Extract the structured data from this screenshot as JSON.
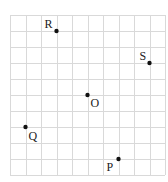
{
  "diagram": {
    "type": "grid-points",
    "grid": {
      "columns": 10,
      "rows": 10,
      "origin_px": [
        10,
        15
      ],
      "cell_w": 15.5,
      "cell_h": 16,
      "line_color": "#d9d9d9"
    },
    "points": [
      {
        "label": "R",
        "col": 3,
        "row": 1,
        "label_dx": -12,
        "label_dy": -3
      },
      {
        "label": "S",
        "col": 9,
        "row": 3,
        "label_dx": -10,
        "label_dy": -3
      },
      {
        "label": "O",
        "col": 5,
        "row": 5,
        "label_dx": 3,
        "label_dy": 12
      },
      {
        "label": "Q",
        "col": 1,
        "row": 7,
        "label_dx": 3,
        "label_dy": 13
      },
      {
        "label": "P",
        "col": 7,
        "row": 9,
        "label_dx": -12,
        "label_dy": 12
      }
    ],
    "dot_color": "#111111"
  }
}
